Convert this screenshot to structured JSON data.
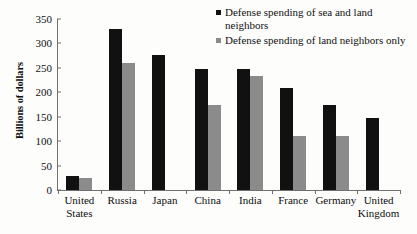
{
  "chart_data": {
    "type": "bar",
    "title": "",
    "xlabel": "",
    "ylabel": "Billions of dollars",
    "ylim": [
      0,
      350
    ],
    "ytick_step": 50,
    "yticks": [
      "350",
      "300",
      "250",
      "200",
      "150",
      "100",
      "50",
      "0"
    ],
    "ytick_values": [
      350,
      300,
      250,
      200,
      150,
      100,
      50,
      0
    ],
    "grid": false,
    "legend_position": "top-right",
    "categories": [
      "United States",
      "Russia",
      "Japan",
      "China",
      "India",
      "France",
      "Germany",
      "United Kingdom"
    ],
    "category_lines": [
      [
        "United",
        "States"
      ],
      [
        "Russia"
      ],
      [
        "Japan"
      ],
      [
        "China"
      ],
      [
        "India"
      ],
      [
        "France"
      ],
      [
        "Germany"
      ],
      [
        "United",
        "Kingdom"
      ]
    ],
    "series": [
      {
        "name": "Defense spending of sea and land neighbors",
        "color": "#111111",
        "values": [
          28,
          330,
          276,
          247,
          247,
          209,
          174,
          147
        ]
      },
      {
        "name": "Defense spending of land neighbors only",
        "color": "#8b8b8b",
        "values": [
          25,
          260,
          null,
          174,
          233,
          110,
          110,
          null
        ]
      }
    ]
  },
  "legend": {
    "items": [
      {
        "label": "Defense spending of sea and land neighbors",
        "color": "#111111"
      },
      {
        "label": "Defense spending of land neighbors only",
        "color": "#8b8b8b"
      }
    ]
  },
  "axis": {
    "y_title": "Billions of dollars"
  }
}
